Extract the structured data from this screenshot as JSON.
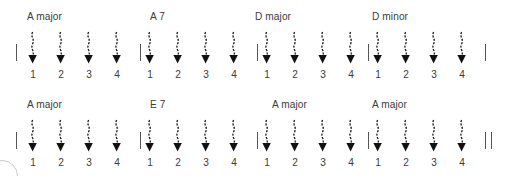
{
  "sheet": {
    "title": "Guitar strumming pattern chart",
    "background_color": "#ffffff",
    "ink_color": "#3b3b3b",
    "line_color": "#555555",
    "beats_per_measure": 4,
    "stroke_direction": "down",
    "beat_labels": [
      "1",
      "2",
      "3",
      "4"
    ],
    "rows": [
      {
        "row_index": 1,
        "start_barline": "single",
        "end_barline": "single",
        "measures": [
          {
            "chord": "A major",
            "beats": [
              {
                "label": "1",
                "stroke": "down"
              },
              {
                "label": "2",
                "stroke": "down"
              },
              {
                "label": "3",
                "stroke": "down"
              },
              {
                "label": "4",
                "stroke": "down"
              }
            ]
          },
          {
            "chord": "A 7",
            "beats": [
              {
                "label": "1",
                "stroke": "down"
              },
              {
                "label": "2",
                "stroke": "down"
              },
              {
                "label": "3",
                "stroke": "down"
              },
              {
                "label": "4",
                "stroke": "down"
              }
            ]
          },
          {
            "chord": "D major",
            "beats": [
              {
                "label": "1",
                "stroke": "down"
              },
              {
                "label": "2",
                "stroke": "down"
              },
              {
                "label": "3",
                "stroke": "down"
              },
              {
                "label": "4",
                "stroke": "down"
              }
            ]
          },
          {
            "chord": "D minor",
            "beats": [
              {
                "label": "1",
                "stroke": "down"
              },
              {
                "label": "2",
                "stroke": "down"
              },
              {
                "label": "3",
                "stroke": "down"
              },
              {
                "label": "4",
                "stroke": "down"
              }
            ]
          }
        ]
      },
      {
        "row_index": 2,
        "start_barline": "single",
        "end_barline": "double",
        "measures": [
          {
            "chord": "A major",
            "beats": [
              {
                "label": "1",
                "stroke": "down"
              },
              {
                "label": "2",
                "stroke": "down"
              },
              {
                "label": "3",
                "stroke": "down"
              },
              {
                "label": "4",
                "stroke": "down"
              }
            ]
          },
          {
            "chord": "E 7",
            "beats": [
              {
                "label": "1",
                "stroke": "down"
              },
              {
                "label": "2",
                "stroke": "down"
              },
              {
                "label": "3",
                "stroke": "down"
              },
              {
                "label": "4",
                "stroke": "down"
              }
            ]
          },
          {
            "chord": "A major",
            "beats": [
              {
                "label": "1",
                "stroke": "down"
              },
              {
                "label": "2",
                "stroke": "down"
              },
              {
                "label": "3",
                "stroke": "down"
              },
              {
                "label": "4",
                "stroke": "down"
              }
            ]
          },
          {
            "chord": "A major",
            "beats": [
              {
                "label": "1",
                "stroke": "down"
              },
              {
                "label": "2",
                "stroke": "down"
              },
              {
                "label": "3",
                "stroke": "down"
              },
              {
                "label": "4",
                "stroke": "down"
              }
            ]
          }
        ]
      }
    ]
  }
}
